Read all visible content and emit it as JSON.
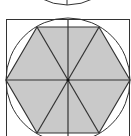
{
  "figure": {
    "colors": {
      "background": "#ffffff",
      "hexagon_fill": "#c9c9c9",
      "stroke": "#333333"
    },
    "center": [
      68,
      80
    ],
    "radius": 62,
    "square": {
      "x": 6,
      "y": 19,
      "width": 124,
      "height": 130
    },
    "hexagon_vertices": [
      [
        130,
        80
      ],
      [
        99,
        27
      ],
      [
        37,
        27
      ],
      [
        6,
        80
      ],
      [
        37,
        133
      ],
      [
        99,
        133
      ]
    ],
    "top_partial_arc": {
      "cx": 67,
      "cy": -40,
      "r": 46,
      "vertical_line_x": 67
    }
  }
}
